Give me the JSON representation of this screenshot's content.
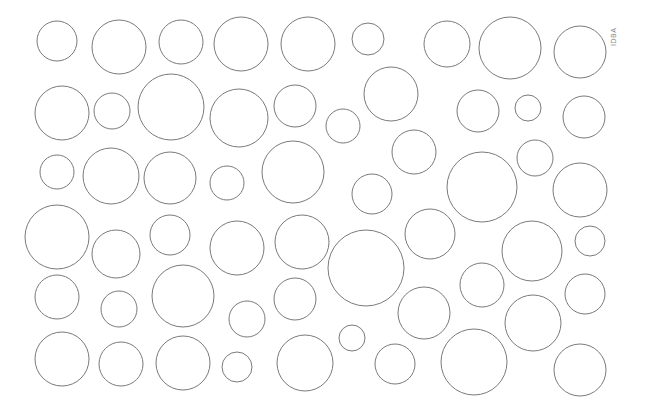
{
  "figure": {
    "stroke_color": "#7a7a7a",
    "background_color": "#ffffff",
    "watermark": "IDBA"
  },
  "circles": [
    {
      "cx": 57,
      "cy": 41,
      "r": 20
    },
    {
      "cx": 119,
      "cy": 47,
      "r": 27
    },
    {
      "cx": 181,
      "cy": 42,
      "r": 22
    },
    {
      "cx": 241,
      "cy": 44,
      "r": 27
    },
    {
      "cx": 308,
      "cy": 44,
      "r": 27
    },
    {
      "cx": 368,
      "cy": 39,
      "r": 16
    },
    {
      "cx": 447,
      "cy": 44,
      "r": 23
    },
    {
      "cx": 510,
      "cy": 48,
      "r": 31
    },
    {
      "cx": 580,
      "cy": 52,
      "r": 26
    },
    {
      "cx": 62,
      "cy": 113,
      "r": 27
    },
    {
      "cx": 112,
      "cy": 111,
      "r": 18
    },
    {
      "cx": 171,
      "cy": 107,
      "r": 33
    },
    {
      "cx": 239,
      "cy": 118,
      "r": 29
    },
    {
      "cx": 295,
      "cy": 106,
      "r": 21
    },
    {
      "cx": 343,
      "cy": 126,
      "r": 17
    },
    {
      "cx": 391,
      "cy": 94,
      "r": 27
    },
    {
      "cx": 478,
      "cy": 111,
      "r": 21
    },
    {
      "cx": 528,
      "cy": 108,
      "r": 13
    },
    {
      "cx": 584,
      "cy": 117,
      "r": 21
    },
    {
      "cx": 57,
      "cy": 172,
      "r": 17
    },
    {
      "cx": 111,
      "cy": 176,
      "r": 28
    },
    {
      "cx": 170,
      "cy": 178,
      "r": 26
    },
    {
      "cx": 227,
      "cy": 183,
      "r": 17
    },
    {
      "cx": 293,
      "cy": 172,
      "r": 31
    },
    {
      "cx": 414,
      "cy": 152,
      "r": 22
    },
    {
      "cx": 372,
      "cy": 194,
      "r": 20
    },
    {
      "cx": 482,
      "cy": 187,
      "r": 35
    },
    {
      "cx": 535,
      "cy": 158,
      "r": 18
    },
    {
      "cx": 580,
      "cy": 190,
      "r": 27
    },
    {
      "cx": 57,
      "cy": 237,
      "r": 32
    },
    {
      "cx": 116,
      "cy": 254,
      "r": 24
    },
    {
      "cx": 170,
      "cy": 235,
      "r": 20
    },
    {
      "cx": 237,
      "cy": 248,
      "r": 27
    },
    {
      "cx": 302,
      "cy": 242,
      "r": 27
    },
    {
      "cx": 366,
      "cy": 268,
      "r": 38
    },
    {
      "cx": 430,
      "cy": 234,
      "r": 25
    },
    {
      "cx": 532,
      "cy": 251,
      "r": 30
    },
    {
      "cx": 590,
      "cy": 241,
      "r": 15
    },
    {
      "cx": 57,
      "cy": 297,
      "r": 22
    },
    {
      "cx": 119,
      "cy": 309,
      "r": 18
    },
    {
      "cx": 183,
      "cy": 296,
      "r": 31
    },
    {
      "cx": 247,
      "cy": 319,
      "r": 18
    },
    {
      "cx": 295,
      "cy": 299,
      "r": 21
    },
    {
      "cx": 424,
      "cy": 313,
      "r": 26
    },
    {
      "cx": 482,
      "cy": 285,
      "r": 22
    },
    {
      "cx": 533,
      "cy": 323,
      "r": 28
    },
    {
      "cx": 585,
      "cy": 294,
      "r": 20
    },
    {
      "cx": 62,
      "cy": 359,
      "r": 27
    },
    {
      "cx": 121,
      "cy": 364,
      "r": 22
    },
    {
      "cx": 183,
      "cy": 363,
      "r": 27
    },
    {
      "cx": 237,
      "cy": 367,
      "r": 15
    },
    {
      "cx": 305,
      "cy": 363,
      "r": 28
    },
    {
      "cx": 352,
      "cy": 338,
      "r": 13
    },
    {
      "cx": 395,
      "cy": 364,
      "r": 20
    },
    {
      "cx": 474,
      "cy": 362,
      "r": 33
    },
    {
      "cx": 580,
      "cy": 370,
      "r": 26
    }
  ]
}
